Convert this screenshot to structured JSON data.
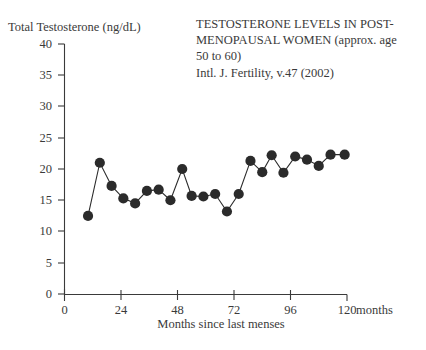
{
  "chart_data": {
    "type": "line",
    "title_lines": [
      "TESTOSTERONE LEVELS IN POST-",
      "MENOPAUSAL WOMEN (approx. age",
      "50 to 60)",
      "Intl. J. Fertility, v.47 (2002)"
    ],
    "source": "Intl. J. Fertility, v.47 (2002)",
    "ylabel": "Total Testosterone (ng/dL)",
    "xlabel": "Months since last menses",
    "x_axis_unit_label": "months",
    "xlim": [
      0,
      120
    ],
    "ylim": [
      0,
      40
    ],
    "xticks": [
      0,
      24,
      48,
      72,
      96,
      120
    ],
    "xtick_labels": [
      "0",
      "24",
      "48",
      "72",
      "96",
      "120"
    ],
    "yticks": [
      0,
      5,
      10,
      15,
      20,
      25,
      30,
      35,
      40
    ],
    "ytick_labels": [
      "0",
      "5",
      "10",
      "15",
      "20",
      "25",
      "30",
      "35",
      "40"
    ],
    "grid": false,
    "legend": false,
    "marker": "filled-circle",
    "series_color": "#2b2b2b",
    "x": [
      10,
      15,
      20,
      25,
      30,
      35,
      40,
      45,
      50,
      54,
      59,
      64,
      69,
      74,
      79,
      84,
      88,
      93,
      98,
      103,
      108,
      113,
      119
    ],
    "y": [
      12.5,
      21.0,
      17.3,
      15.3,
      14.5,
      16.5,
      16.7,
      15.0,
      20.0,
      15.7,
      15.6,
      16.0,
      13.2,
      16.0,
      21.3,
      19.5,
      22.2,
      19.4,
      22.0,
      21.5,
      20.5,
      22.3,
      22.3
    ],
    "points": [
      {
        "x": 10,
        "y": 12.5
      },
      {
        "x": 15,
        "y": 21.0
      },
      {
        "x": 20,
        "y": 17.3
      },
      {
        "x": 25,
        "y": 15.3
      },
      {
        "x": 30,
        "y": 14.5
      },
      {
        "x": 35,
        "y": 16.5
      },
      {
        "x": 40,
        "y": 16.7
      },
      {
        "x": 45,
        "y": 15.0
      },
      {
        "x": 50,
        "y": 20.0
      },
      {
        "x": 54,
        "y": 15.7
      },
      {
        "x": 59,
        "y": 15.6
      },
      {
        "x": 64,
        "y": 16.0
      },
      {
        "x": 69,
        "y": 13.2
      },
      {
        "x": 74,
        "y": 16.0
      },
      {
        "x": 79,
        "y": 21.3
      },
      {
        "x": 84,
        "y": 19.5
      },
      {
        "x": 88,
        "y": 22.2
      },
      {
        "x": 93,
        "y": 19.4
      },
      {
        "x": 98,
        "y": 22.0
      },
      {
        "x": 103,
        "y": 21.5
      },
      {
        "x": 108,
        "y": 20.5
      },
      {
        "x": 113,
        "y": 22.3
      },
      {
        "x": 119,
        "y": 22.3
      }
    ]
  }
}
